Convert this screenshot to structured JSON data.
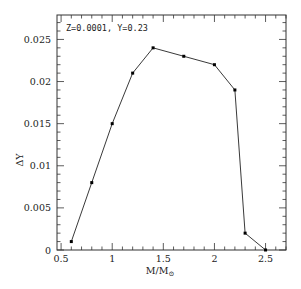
{
  "chart_data": {
    "type": "line",
    "title": "",
    "annotation": "Z=0.0001, Y=0.23",
    "xlabel": "M/M",
    "xlabel_subscript": "⊙",
    "ylabel": "ΔY",
    "xlim": [
      0.46,
      2.7
    ],
    "ylim": [
      0,
      0.0279
    ],
    "xticks": [
      0.5,
      1,
      1.5,
      2,
      2.5
    ],
    "xtick_labels": [
      "0.5",
      "1",
      "1.5",
      "2",
      "2.5"
    ],
    "yticks": [
      0,
      0.005,
      0.01,
      0.015,
      0.02,
      0.025
    ],
    "ytick_labels": [
      "0",
      "0.005",
      "0.01",
      "0.015",
      "0.02",
      "0.025"
    ],
    "grid": false,
    "legend": null,
    "series": [
      {
        "name": "Z=0.0001, Y=0.23",
        "marker": "dot",
        "color": "#000000",
        "x": [
          0.6,
          0.8,
          1.0,
          1.2,
          1.4,
          1.7,
          2.0,
          2.2,
          2.3,
          2.5
        ],
        "y": [
          0.001,
          0.008,
          0.015,
          0.021,
          0.024,
          0.023,
          0.022,
          0.019,
          0.002,
          0.0
        ]
      }
    ]
  }
}
